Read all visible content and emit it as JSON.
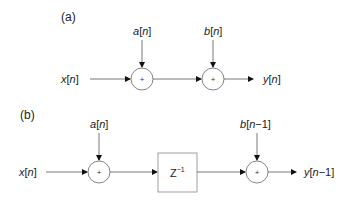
{
  "panel_a": {
    "label": "(a)",
    "input": {
      "name": "x",
      "index": "n"
    },
    "adder1_input": {
      "name": "a",
      "index": "n"
    },
    "adder2_input": {
      "name": "b",
      "index": "n"
    },
    "output": {
      "name": "y",
      "index": "n"
    },
    "adder_symbol": "+"
  },
  "panel_b": {
    "label": "(b)",
    "input": {
      "name": "x",
      "index": "n"
    },
    "adder1_input": {
      "name": "a",
      "index": "n"
    },
    "delay": {
      "base": "Z",
      "exp": "−1"
    },
    "adder2_input": {
      "name": "b",
      "index": "n−1"
    },
    "output": {
      "name": "y",
      "index": "n−1"
    },
    "adder_symbol": "+"
  }
}
